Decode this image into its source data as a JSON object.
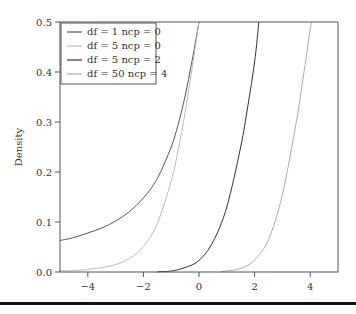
{
  "chart_data": {
    "type": "line",
    "title": "",
    "xlabel": "",
    "ylabel": "Density",
    "xlim": [
      -5,
      5
    ],
    "ylim": [
      0,
      0.5
    ],
    "grid": false,
    "legend_position": "top-left",
    "x_ticks": [
      -4,
      -2,
      0,
      2,
      4
    ],
    "x_tick_labels": [
      "−4",
      "−2",
      "0",
      "2",
      "4"
    ],
    "y_ticks": [
      0.0,
      0.1,
      0.2,
      0.3,
      0.4,
      0.5
    ],
    "y_tick_labels": [
      "0.0",
      "0.1",
      "0.2",
      "0.3",
      "0.4",
      "0.5"
    ],
    "series": [
      {
        "name": "df = 1 ncp = 0",
        "color": "#555555",
        "x": [
          -5,
          -4.5,
          -4,
          -3.5,
          -3,
          -2.5,
          -2,
          -1.5,
          -1,
          -0.75,
          -0.5,
          -0.25,
          0
        ],
        "y": [
          0.063,
          0.069,
          0.078,
          0.088,
          0.102,
          0.121,
          0.148,
          0.187,
          0.25,
          0.295,
          0.352,
          0.422,
          0.5
        ]
      },
      {
        "name": "df = 5 ncp = 0",
        "color": "#bbbbbb",
        "x": [
          -5,
          -4.5,
          -4,
          -3.5,
          -3,
          -2.5,
          -2,
          -1.5,
          -1,
          -0.75,
          -0.5,
          -0.25,
          0
        ],
        "y": [
          0.002,
          0.003,
          0.005,
          0.009,
          0.015,
          0.027,
          0.051,
          0.097,
          0.182,
          0.243,
          0.319,
          0.406,
          0.5
        ]
      },
      {
        "name": "df = 5 ncp = 2",
        "color": "#333333",
        "x": [
          -1.5,
          -1,
          -0.5,
          0,
          0.5,
          1,
          1.5,
          1.75,
          2,
          2.15
        ],
        "y": [
          0.0005,
          0.002,
          0.009,
          0.023,
          0.06,
          0.13,
          0.25,
          0.33,
          0.42,
          0.5
        ]
      },
      {
        "name": "df = 50 ncp = 4",
        "color": "#aaaaaa",
        "x": [
          0.8,
          1.5,
          2,
          2.5,
          3,
          3.5,
          3.75,
          4,
          4.05
        ],
        "y": [
          0.0008,
          0.007,
          0.024,
          0.065,
          0.155,
          0.3,
          0.39,
          0.485,
          0.5
        ]
      }
    ]
  }
}
